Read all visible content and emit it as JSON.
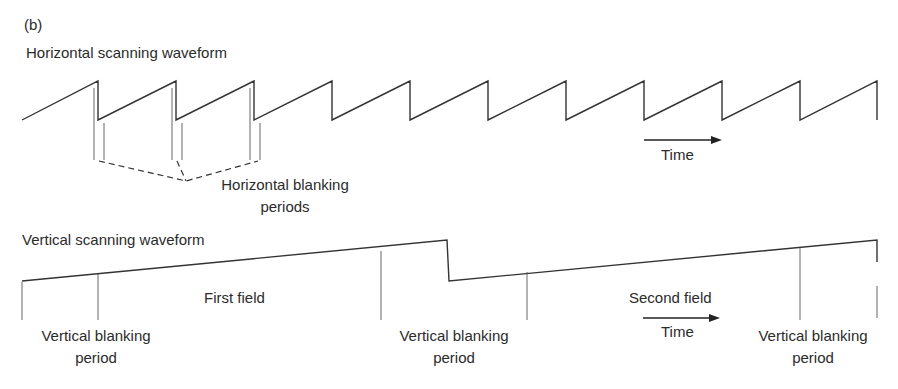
{
  "figure": {
    "panel_label": "(b)",
    "horizontal": {
      "title": "Horizontal scanning waveform",
      "blanking_label_line1": "Horizontal blanking",
      "blanking_label_line2": "periods",
      "time_label": "Time"
    },
    "vertical": {
      "title": "Vertical scanning waveform",
      "first_field": "First field",
      "second_field": "Second field",
      "time_label": "Time",
      "blanking_labels": [
        {
          "line1": "Vertical blanking",
          "line2": "period"
        },
        {
          "line1": "Vertical blanking",
          "line2": "period"
        },
        {
          "line1": "Vertical blanking",
          "line2": "period"
        }
      ]
    },
    "colors": {
      "line": "#333333",
      "text": "#2b2b2b",
      "background": "#ffffff"
    }
  }
}
